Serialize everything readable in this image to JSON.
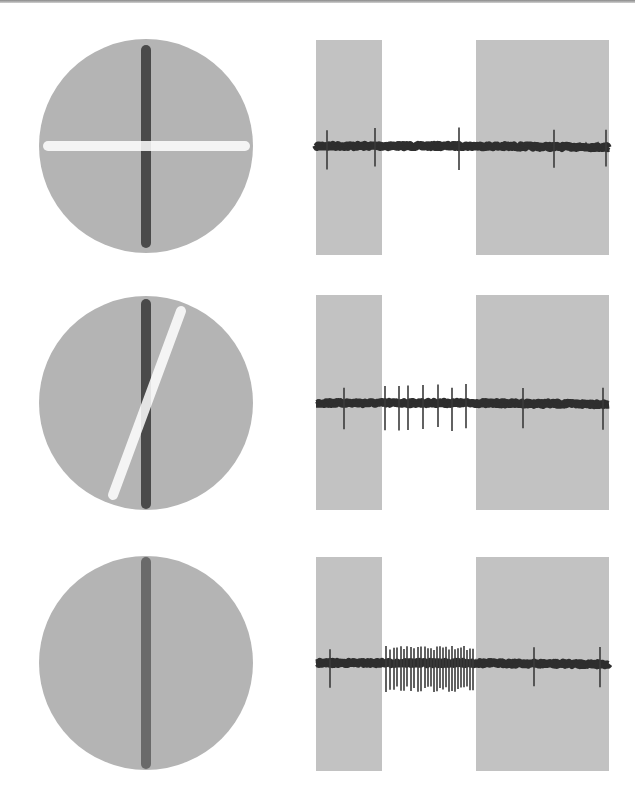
{
  "figure": {
    "background": "#ffffff",
    "top_rule_color": "#999999",
    "rows": [
      {
        "id": "row-1",
        "stimulus": {
          "circle": {
            "cx": 146,
            "cy": 146,
            "r": 107,
            "fill": "#b4b4b4"
          },
          "bars": [
            {
              "name": "receptive-field-bar",
              "x1": 146,
              "y1": 50,
              "x2": 146,
              "y2": 243,
              "width": 10,
              "color": "#4a4a4a",
              "opacity": 1
            },
            {
              "name": "stimulus-bar",
              "x1": 48,
              "y1": 146,
              "x2": 245,
              "y2": 146,
              "width": 10,
              "color": "#ffffff",
              "opacity": 0.85
            }
          ]
        },
        "trace": {
          "baseline_y": 146,
          "stim_off_rects": [
            {
              "x": 316,
              "y": 40,
              "w": 66,
              "h": 215
            },
            {
              "x": 476,
              "y": 40,
              "w": 133,
              "h": 215
            }
          ],
          "spikes": [
            327,
            375,
            459,
            554,
            606
          ],
          "spike_up": 17,
          "spike_down": 22
        }
      },
      {
        "id": "row-2",
        "stimulus": {
          "circle": {
            "cx": 146,
            "cy": 403,
            "r": 107,
            "fill": "#b4b4b4"
          },
          "bars": [
            {
              "name": "receptive-field-bar",
              "x1": 146,
              "y1": 304,
              "x2": 146,
              "y2": 504,
              "width": 10,
              "color": "#4a4a4a",
              "opacity": 1
            },
            {
              "name": "stimulus-bar",
              "x1": 181,
              "y1": 311,
              "x2": 113,
              "y2": 495,
              "width": 10,
              "color": "#ffffff",
              "opacity": 0.85
            }
          ]
        },
        "trace": {
          "baseline_y": 403,
          "stim_off_rects": [
            {
              "x": 316,
              "y": 295,
              "w": 66,
              "h": 215
            },
            {
              "x": 476,
              "y": 295,
              "w": 133,
              "h": 215
            }
          ],
          "spikes": [
            344,
            385,
            399,
            408,
            423,
            438,
            452,
            466,
            523,
            603
          ],
          "spike_up": 17,
          "spike_down": 27
        }
      },
      {
        "id": "row-3",
        "stimulus": {
          "circle": {
            "cx": 146,
            "cy": 663,
            "r": 107,
            "fill": "#b4b4b4"
          },
          "bars": [
            {
              "name": "receptive-field-bar",
              "x1": 146,
              "y1": 562,
              "x2": 146,
              "y2": 764,
              "width": 10,
              "color": "#6a6a6a",
              "opacity": 1
            }
          ]
        },
        "trace": {
          "baseline_y": 663,
          "stim_off_rects": [
            {
              "x": 316,
              "y": 557,
              "w": 66,
              "h": 214
            },
            {
              "x": 476,
              "y": 557,
              "w": 133,
              "h": 214
            }
          ],
          "spikes": [
            330,
            386,
            390,
            394,
            397,
            401,
            404,
            407,
            411,
            414,
            418,
            421,
            425,
            428,
            431,
            434,
            437,
            440,
            443,
            446,
            449,
            452,
            455,
            458,
            461,
            464,
            467,
            470,
            473,
            534,
            600
          ],
          "spike_up": 15,
          "spike_down": 26
        }
      }
    ],
    "colors": {
      "rect_fill": "#c2c2c2",
      "trace_color": "#2e2e2e",
      "spike_color": "#3a3a3a"
    }
  }
}
